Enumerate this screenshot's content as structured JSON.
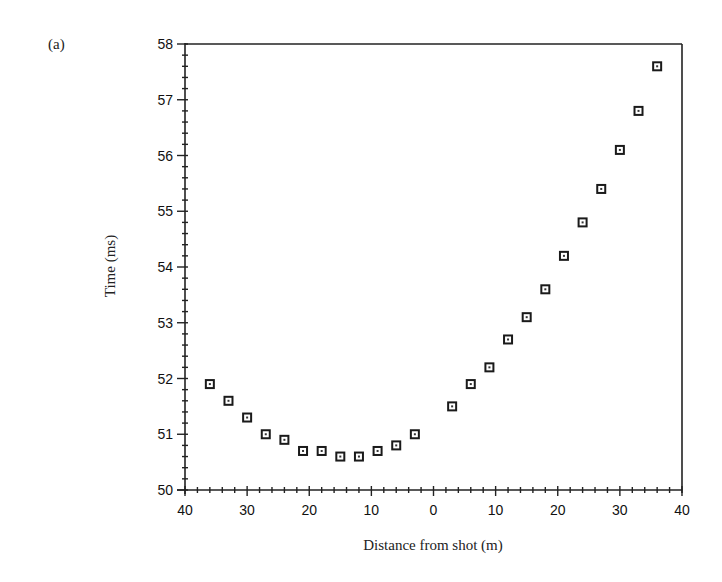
{
  "panel_label": "(a)",
  "chart_data": {
    "type": "scatter",
    "title": "",
    "xlabel": "Distance from shot (m)",
    "ylabel": "Time (ms)",
    "xlim": [
      -40,
      40
    ],
    "ylim": [
      50,
      58
    ],
    "x_tick_values": [
      -40,
      -30,
      -20,
      -10,
      0,
      10,
      20,
      30,
      40
    ],
    "x_tick_labels": [
      "40",
      "30",
      "20",
      "10",
      "0",
      "10",
      "20",
      "30",
      "40"
    ],
    "y_tick_values": [
      50,
      51,
      52,
      53,
      54,
      55,
      56,
      57,
      58
    ],
    "y_tick_labels": [
      "50",
      "51",
      "52",
      "53",
      "54",
      "55",
      "56",
      "57",
      "58"
    ],
    "x_minor_step": 2,
    "y_minor_step": 0.2,
    "grid": false,
    "legend": null,
    "marker": "open-square-with-dot",
    "series": [
      {
        "name": "first arrivals",
        "x": [
          -36,
          -33,
          -30,
          -27,
          -24,
          -21,
          -18,
          -15,
          -12,
          -9,
          -6,
          -3,
          3,
          6,
          9,
          12,
          15,
          18,
          21,
          24,
          27,
          30,
          33,
          36
        ],
        "y": [
          51.9,
          51.6,
          51.3,
          51.0,
          50.9,
          50.7,
          50.7,
          50.6,
          50.6,
          50.7,
          50.8,
          51.0,
          51.5,
          51.9,
          52.2,
          52.7,
          53.1,
          53.6,
          54.2,
          54.8,
          55.4,
          56.1,
          56.8,
          57.6
        ]
      }
    ]
  }
}
